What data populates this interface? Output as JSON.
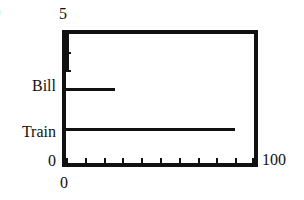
{
  "chart_data": {
    "type": "bar",
    "orientation": "horizontal",
    "title": "",
    "xlabel": "",
    "ylabel": "",
    "xlim": [
      0,
      100
    ],
    "ylim": [
      0,
      5
    ],
    "grid": false,
    "legend": false,
    "categories": [
      "Train",
      "Bill"
    ],
    "series": [
      {
        "name": "value",
        "values": [
          90,
          26
        ]
      }
    ],
    "y_positions": {
      "Train": 1.3,
      "Bill": 2.85
    },
    "extra_marks": [
      {
        "type": "vertical-spike",
        "x": 0,
        "y_from": 3.6,
        "y_to": 5.0
      }
    ],
    "x_axis": {
      "min_label": "0",
      "max_label": "100",
      "tick_count": 10,
      "tick_values": [
        0,
        10,
        20,
        30,
        40,
        50,
        60,
        70,
        80,
        90,
        100
      ]
    },
    "y_axis": {
      "min_label": "0",
      "max_label": "5",
      "category_labels": [
        "Bill",
        "Train"
      ],
      "tick_values": [
        1.3,
        2.85,
        3.6,
        4.3
      ]
    },
    "colors": {
      "frame": "#111111",
      "bars": "#111111",
      "background": "#ffffff"
    }
  },
  "labels": {
    "y_max": "5",
    "y_zero": "0",
    "x_zero": "0",
    "x_max": "100",
    "category_bill": "Bill",
    "category_train": "Train",
    "edge_glyph": "0"
  }
}
